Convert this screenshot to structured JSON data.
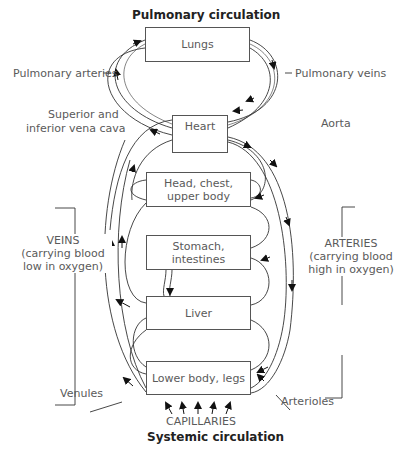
{
  "titles": {
    "top": "Pulmonary circulation",
    "bottom": "Systemic circulation"
  },
  "boxes": {
    "lungs": "Lungs",
    "heart": "Heart",
    "head": "Head, chest, upper body",
    "stomach": "Stomach, intestines",
    "liver": "Liver",
    "lower": "Lower body, legs"
  },
  "labels": {
    "pulmonary_arteries": "Pulmonary arteries",
    "pulmonary_veins": "Pulmonary veins",
    "vena_cava_1": "Superior and",
    "vena_cava_2": "inferior vena cava",
    "aorta": "Aorta",
    "veins_1": "VEINS",
    "veins_2": "(carrying blood",
    "veins_3": "low in oxygen)",
    "arteries_1": "ARTERIES",
    "arteries_2": "(carrying blood",
    "arteries_3": "high in oxygen)",
    "venules": "Venules",
    "arterioles": "Arterioles",
    "capillaries": "CAPILLARIES"
  }
}
